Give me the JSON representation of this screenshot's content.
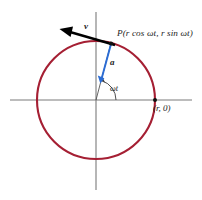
{
  "figure": {
    "background_color": "#ffffff",
    "circle_color": "#a51f33",
    "axis_color": "#777777",
    "velocity_color": "#000000",
    "acceleration_color": "#2b6cd4",
    "text_color": "#1b1b1b"
  },
  "labels": {
    "point_P": "P(r cos ωt, r sin ωt)",
    "point_P_parts": {
      "prefix": "P(",
      "cos_term": "r cos ωt",
      "separator": ", ",
      "sin_term": "r sin ωt",
      "suffix": ")"
    },
    "velocity_vector": "v",
    "acceleration_vector": "a",
    "angle": "ωt",
    "x_intercept": "(r, 0)"
  },
  "geometry": {
    "center_x": 96,
    "center_y": 100,
    "radius": 59,
    "point_P_x": 111,
    "point_P_y": 43,
    "point_r0_x": 155,
    "point_r0_y": 100,
    "velocity_tip_x": 61,
    "velocity_tip_y": 30,
    "acceleration_tip_x": 100,
    "acceleration_tip_y": 81,
    "angle_degrees": 75
  }
}
